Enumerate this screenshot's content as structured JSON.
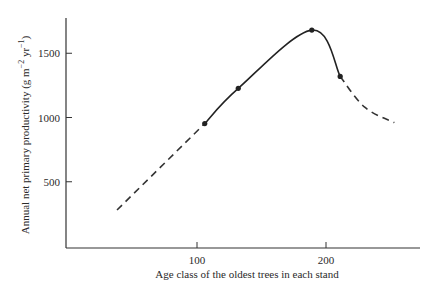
{
  "chart_data": {
    "type": "line",
    "title": "",
    "xlabel": "Age class of the oldest trees in each stand",
    "ylabel": "Annual net primary productivity (g m^-2 yr^-1)",
    "ylabel_parts": {
      "main": "Annual net primary productivity (g m",
      "exp1": "−2",
      "mid": " yr",
      "exp2": "−1",
      "end": ")"
    },
    "xlim": [
      0,
      290
    ],
    "ylim": [
      0,
      1800
    ],
    "xticks": [
      100,
      200
    ],
    "xtick_labels": [
      "100",
      "200"
    ],
    "yticks": [
      500,
      1000,
      1500
    ],
    "ytick_labels": [
      "500",
      "1000",
      "1500"
    ],
    "grid": false,
    "legend": "none",
    "series": [
      {
        "name": "extrapolated-rising",
        "style": "dashed",
        "x": [
          38,
          106
        ],
        "y": [
          280,
          953
        ]
      },
      {
        "name": "observed",
        "style": "solid",
        "markers": true,
        "x": [
          106,
          132,
          189,
          211
        ],
        "y": [
          953,
          1227,
          1680,
          1320
        ]
      },
      {
        "name": "extrapolated-declining",
        "style": "dashed",
        "x": [
          211,
          230,
          253
        ],
        "y": [
          1320,
          1080,
          960
        ]
      }
    ]
  }
}
